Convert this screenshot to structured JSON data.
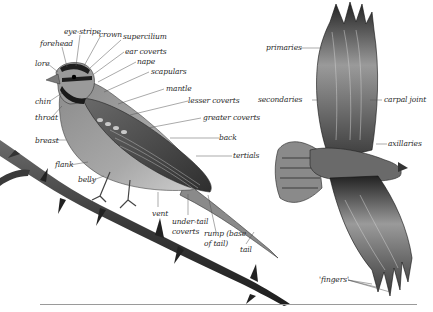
{
  "diagram": {
    "type": "anatomy-illustration",
    "subjects": [
      "perched songbird (side view)",
      "raptor in flight (underside view)"
    ]
  },
  "songbird_labels": {
    "forehead": "forehead",
    "eye_stripe": "eye-stripe",
    "crown": "crown",
    "supercilium": "supercilium",
    "ear_coverts": "ear coverts",
    "nape": "nape",
    "scapulars": "scapulars",
    "lore": "lore",
    "mantle": "mantle",
    "lesser_coverts": "lesser coverts",
    "greater_coverts": "greater coverts",
    "chin": "chin",
    "throat": "throat",
    "back": "back",
    "breast": "breast",
    "tertials": "tertials",
    "flank": "flank",
    "belly": "belly",
    "vent": "vent",
    "under_tail_coverts_1": "under-tail",
    "under_tail_coverts_2": "coverts",
    "rump_1": "rump (base",
    "rump_2": "of tail)",
    "tail": "tail"
  },
  "raptor_labels": {
    "primaries": "primaries",
    "secondaries": "secondaries",
    "carpal_joint": "carpal joint",
    "axillaries": "axillaries",
    "fingers": "'fingers'"
  },
  "colors": {
    "label_text": "#2a2a2a",
    "leader_line": "#555555",
    "baseline": "#9a9a9a"
  }
}
